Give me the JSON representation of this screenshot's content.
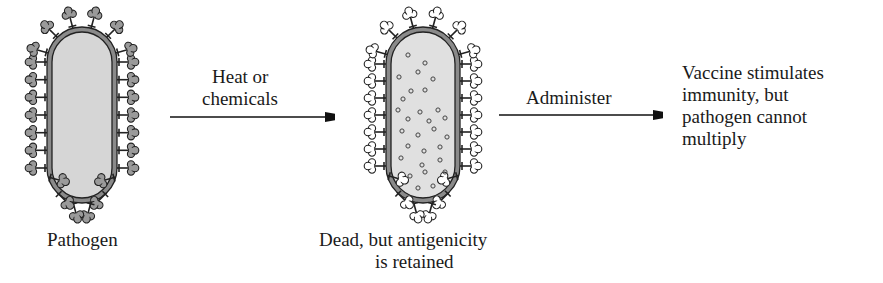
{
  "diagram": {
    "type": "process-flow",
    "topic": "inactivated vaccine preparation",
    "stages": [
      {
        "id": "pathogen",
        "label": "Pathogen",
        "fill": "#d6d6d6",
        "spike_fill": "#9a9a9a"
      },
      {
        "id": "dead",
        "label_line1": "Dead, but antigenicity",
        "label_line2": "is retained",
        "fill": "#e0e0e0",
        "spike_fill": "#ffffff"
      },
      {
        "id": "outcome",
        "lines": [
          "Vaccine stimulates",
          "immunity, but",
          "pathogen cannot",
          "multiply"
        ]
      }
    ],
    "arrows": [
      {
        "from": "pathogen",
        "to": "dead",
        "label_line1": "Heat or",
        "label_line2": "chemicals"
      },
      {
        "from": "dead",
        "to": "outcome",
        "label": "Administer"
      }
    ]
  }
}
